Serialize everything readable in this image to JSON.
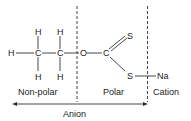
{
  "diagram": {
    "atoms": {
      "h_left": "H",
      "c1_top_h": "H",
      "c2_top_h": "H",
      "c1": "C",
      "c2": "C",
      "c1_bottom_h": "H",
      "c2_bottom_h": "H",
      "o": "O",
      "c3": "C",
      "s_double": "S",
      "s_single": "S",
      "na": "Na"
    },
    "regions": {
      "nonpolar": "Non-polar",
      "polar": "Polar",
      "cation": "Cation",
      "anion": "Anion"
    },
    "colors": {
      "line": "#333333",
      "text": "#222222",
      "background": "#ffffff"
    }
  }
}
